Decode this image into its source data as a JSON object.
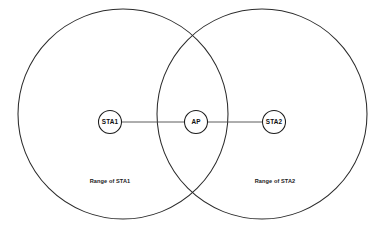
{
  "diagram": {
    "background_color": "#ffffff",
    "stroke_color": "#2b2b2b",
    "coverage_areas": [
      {
        "id": "range-sta1",
        "label": "Range of STA1",
        "center_x": 123,
        "center_y": 114,
        "radius": 105
      },
      {
        "id": "range-sta2",
        "label": "Range of STA2",
        "center_x": 262,
        "center_y": 114,
        "radius": 105
      }
    ],
    "nodes": [
      {
        "id": "sta1",
        "label": "STA1",
        "center_x": 110,
        "center_y": 122,
        "radius": 11.5
      },
      {
        "id": "ap",
        "label": "AP",
        "center_x": 196,
        "center_y": 122,
        "radius": 11.5
      },
      {
        "id": "sta2",
        "label": "STA2",
        "center_x": 274,
        "center_y": 122,
        "radius": 11.5
      }
    ],
    "links": [
      {
        "id": "link-sta1-ap",
        "from": "sta1",
        "to": "ap",
        "x1": 121.5,
        "y1": 122,
        "x2": 184.5,
        "y2": 122
      },
      {
        "id": "link-ap-sta2",
        "from": "ap",
        "to": "sta2",
        "x1": 207.5,
        "y1": 122,
        "x2": 262.5,
        "y2": 122
      }
    ],
    "range_label_positions": [
      {
        "id": "range-label-sta1",
        "x": 110,
        "y": 182
      },
      {
        "id": "range-label-sta2",
        "x": 275,
        "y": 182
      }
    ]
  }
}
